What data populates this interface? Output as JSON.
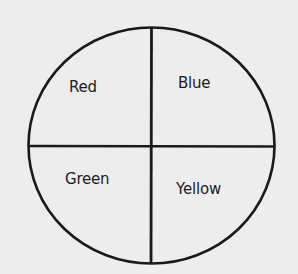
{
  "diagram": {
    "type": "circle-divided-into-quadrants",
    "stroke_color": "#1a1a1a",
    "background_color": "#ededed",
    "quadrants": [
      {
        "position": "top-left",
        "label": "Red"
      },
      {
        "position": "top-right",
        "label": "Blue"
      },
      {
        "position": "bottom-left",
        "label": "Green"
      },
      {
        "position": "bottom-right",
        "label": "Yellow"
      }
    ]
  }
}
